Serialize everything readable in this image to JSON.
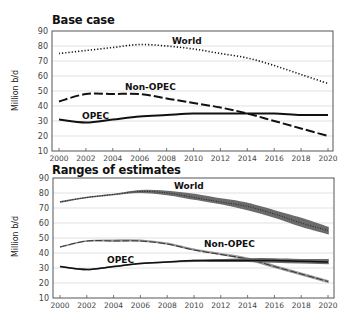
{
  "chart_data": [
    {
      "type": "line",
      "title": "Base case",
      "xlabel": "",
      "ylabel": "Million b/d",
      "ylim": [
        10,
        90
      ],
      "yticks": [
        10,
        20,
        30,
        40,
        50,
        60,
        70,
        80,
        90
      ],
      "x": [
        2000,
        2002,
        2004,
        2006,
        2008,
        2010,
        2012,
        2014,
        2016,
        2018,
        2020
      ],
      "xtick_labels": [
        "2000",
        "2002",
        "2004",
        "2006",
        "2008",
        "2010",
        "2012",
        "2014",
        "2016",
        "2018",
        "2020"
      ],
      "grid": true,
      "legend": "inline labels",
      "series": [
        {
          "name": "World",
          "style": "dotted",
          "values": [
            75,
            77,
            79,
            81,
            80,
            78,
            75,
            72,
            67,
            61,
            55
          ]
        },
        {
          "name": "Non-OPEC",
          "style": "dashed",
          "values": [
            43,
            48,
            48,
            48,
            45,
            42,
            39,
            35,
            30,
            25,
            20
          ]
        },
        {
          "name": "OPEC",
          "style": "solid",
          "values": [
            31,
            29,
            31,
            33,
            34,
            35,
            35,
            35,
            35,
            34,
            34
          ]
        }
      ]
    },
    {
      "type": "area",
      "title": "Ranges of estimates",
      "xlabel": "",
      "ylabel": "Million b/d",
      "ylim": [
        10,
        90
      ],
      "yticks": [
        10,
        20,
        30,
        40,
        50,
        60,
        70,
        80,
        90
      ],
      "x": [
        2000,
        2002,
        2004,
        2006,
        2008,
        2010,
        2012,
        2014,
        2016,
        2018,
        2020
      ],
      "xtick_labels": [
        "2000",
        "2002",
        "2004",
        "2006",
        "2008",
        "2010",
        "2012",
        "2014",
        "2016",
        "2018",
        "2020"
      ],
      "grid": true,
      "legend": "inline labels",
      "series": [
        {
          "name": "World",
          "style": "dotted with range band",
          "values": [
            74,
            77,
            79,
            81,
            80,
            77,
            74,
            71,
            66,
            60,
            55
          ],
          "low": [
            74,
            77,
            79,
            80.5,
            79,
            76,
            73,
            69,
            64,
            58,
            53
          ],
          "high": [
            74,
            77,
            79,
            81.5,
            81,
            79,
            76,
            73,
            68,
            63,
            57
          ]
        },
        {
          "name": "Non-OPEC",
          "style": "dashed with range band",
          "values": [
            44,
            48,
            48,
            48,
            46,
            42,
            39,
            36,
            31,
            26,
            21
          ],
          "low": [
            44,
            48,
            48,
            48,
            46,
            42,
            39,
            35.5,
            30.5,
            25.5,
            20.5
          ],
          "high": [
            44,
            48,
            48.5,
            48.5,
            46.5,
            42.5,
            39.5,
            36.5,
            31.5,
            26.5,
            21.5
          ]
        },
        {
          "name": "OPEC",
          "style": "solid with range band",
          "values": [
            31,
            29,
            31,
            33,
            34,
            35,
            35,
            35,
            35,
            34.5,
            34
          ],
          "low": [
            31,
            29,
            31,
            33,
            34,
            34.5,
            34.5,
            34.5,
            34,
            33.5,
            33
          ],
          "high": [
            31,
            29,
            31,
            33,
            34,
            35,
            35.5,
            36,
            36,
            35.5,
            35.5
          ]
        }
      ]
    }
  ],
  "panels": {
    "top": {
      "title": "Base case",
      "ylabel": "Million b/d",
      "labels": {
        "world": "World",
        "nonopec": "Non-OPEC",
        "opec": "OPEC"
      }
    },
    "bottom": {
      "title": "Ranges of estimates",
      "ylabel": "Million b/d",
      "labels": {
        "world": "World",
        "nonopec": "Non-OPEC",
        "opec": "OPEC"
      }
    }
  },
  "colors": {
    "line": "#111111",
    "band": "#6b6b6b",
    "nonopec_band": "#9a9a9a",
    "grid": "#d9d9d9",
    "frame": "#555555",
    "tick_text": "#444444"
  }
}
